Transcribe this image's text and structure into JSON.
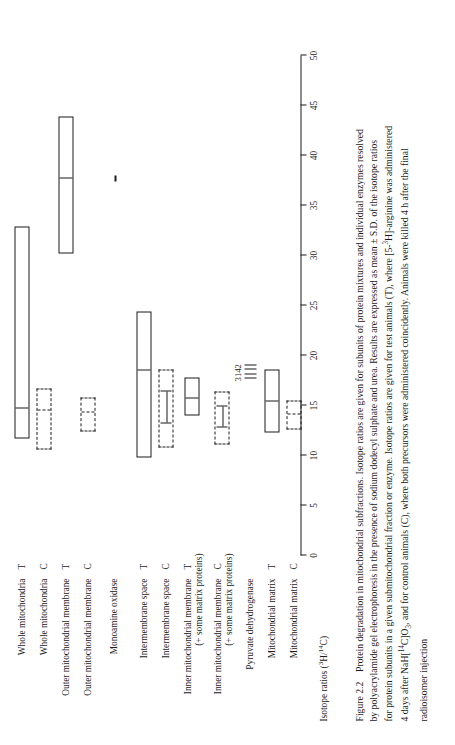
{
  "figure": {
    "number": "Figure 2.2",
    "title_text": "Protein degradation in mitochondrial subfractions. Isotope ratios are given for subunits of protein mixtures and individual enzymes resolved by polyacrylamide gel electrophoresis in the presence of sodium dodecyl sulphate and urea. Results are expressed as mean ± S.D. of the isotope ratios for protein subunits in a given submitochondrial fraction or enzyme. Isotope ratios are given for test animals (T), where [5-³H]-arginine was administered 4 days after NaH[¹⁴C]O₃, and for control animals (C), where both precursors were administered coincidently. Animals were killed 4 h after the final radioisomer injection",
    "caption_lines": [
      "Figure 2.2    Protein degradation in mitochondrial subfractions. Isotope ratios are given for subunits of protein mixtures and individual enzymes resolved",
      "by polyacrylamide gel electrophoresis in the presence of sodium dodecyl sulphate and urea. Results are expressed as mean ± S.D. of the isotope ratios",
      "for protein subunits in a given submitochondrial fraction or enzyme. Isotope ratios are given for test animals (T), where [5-³H]-arginine was administered",
      "4 days after NaH[¹⁴C]O₃, and for control animals (C), where both precursors were administered coincidently. Animals were killed 4 h after the final",
      "radioisomer injection"
    ]
  },
  "chart_data": {
    "type": "bar",
    "orientation": "horizontal-range",
    "title": "",
    "xlabel": "Isotope ratios (3H/14C)",
    "xlabel_rich": "Isotope ratios (³H/¹⁴C)",
    "ylabel": "",
    "xlim": [
      0,
      50
    ],
    "xticks": [
      0,
      5,
      10,
      15,
      20,
      25,
      30,
      35,
      40,
      45,
      50
    ],
    "xticklabels": [
      "0",
      "5",
      "10",
      "15",
      "20",
      "25",
      "30",
      "35",
      "40",
      "45",
      "50"
    ],
    "grid": false,
    "legend": {
      "T": "test animals (solid box)",
      "C": "control animals (dashed box)"
    },
    "annotations": [
      {
        "text": "3",
        "near": "Inner mitochondrial membrane C"
      },
      {
        "text": "1",
        "near": "Inner mitochondrial membrane C"
      },
      {
        "text": "4",
        "near": "Inner mitochondrial membrane C"
      },
      {
        "text": "2",
        "near": "Inner mitochondrial membrane C"
      }
    ],
    "categories": [
      {
        "label": "Whole mitochondria",
        "suffix": "T",
        "style": "solid",
        "low": 9.3,
        "high": 30.5,
        "mean": 12.2
      },
      {
        "label": "Whole mitochondria",
        "suffix": "C",
        "style": "dashed",
        "low": 8.2,
        "high": 14.3,
        "mean": 12.0
      },
      {
        "label": "Outer mitochondrial membrane",
        "suffix": "T",
        "style": "solid",
        "low": 27.8,
        "high": 41.5,
        "mean": 35.2
      },
      {
        "label": "Outer mitochondrial membrane",
        "suffix": "C",
        "style": "dashed",
        "low": 10.0,
        "high": 13.4,
        "mean": 11.8
      },
      {
        "label": "Monoamine oxidase",
        "suffix": "",
        "style": "segment",
        "low": 35.0,
        "high": 35.6,
        "mean": 35.3
      },
      {
        "label": "Intermembrane space",
        "suffix": "T",
        "style": "solid",
        "low": 7.4,
        "high": 22.0,
        "mean": 16.0
      },
      {
        "label": "Intermembrane space",
        "suffix": "C",
        "style": "dashed-ibar",
        "low": 8.4,
        "high": 16.2,
        "mean": 12.3
      },
      {
        "label": "Inner mitochondrial membrane",
        "label2": "(+ some matrix proteins)",
        "suffix": "T",
        "style": "solid",
        "low": 11.6,
        "high": 15.4,
        "mean": 13.2
      },
      {
        "label": "Inner mitochondrial membrane",
        "label2": "(+ some matrix proteins)",
        "suffix": "C",
        "style": "dashed-ibar",
        "low": 8.7,
        "high": 14.0,
        "mean": 11.3
      },
      {
        "label": "Pyruvate dehydrogenase",
        "suffix": "",
        "style": "ticks",
        "low": 15.3,
        "high": 16.6,
        "mean": 16.0
      },
      {
        "label": "Mitochondrial matrix",
        "suffix": "T",
        "style": "solid",
        "low": 9.9,
        "high": 16.2,
        "mean": 12.9
      },
      {
        "label": "Mitochondrial matrix",
        "suffix": "C",
        "style": "dashed",
        "low": 10.2,
        "high": 13.1,
        "mean": 11.6
      }
    ]
  }
}
